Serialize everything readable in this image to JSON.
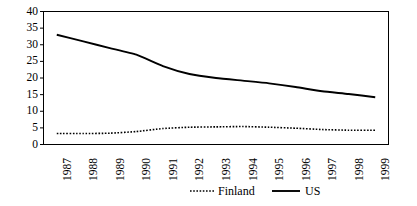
{
  "chart_data": {
    "type": "line",
    "title": "",
    "subtitle": "",
    "xlabel": "",
    "ylabel": "",
    "categories": [
      "1987",
      "1988",
      "1989",
      "1990",
      "1991",
      "1992",
      "1993",
      "1994",
      "1995",
      "1996",
      "1997",
      "1998",
      "1999"
    ],
    "x": [
      1987,
      1988,
      1989,
      1990,
      1991,
      1992,
      1993,
      1994,
      1995,
      1996,
      1997,
      1998,
      1999
    ],
    "series": [
      {
        "name": "Finland",
        "style": "dotted",
        "color": "#000000",
        "values": [
          3.3,
          3.3,
          3.4,
          3.9,
          4.8,
          5.2,
          5.3,
          5.4,
          5.2,
          4.9,
          4.5,
          4.3,
          4.3
        ]
      },
      {
        "name": "US",
        "style": "solid",
        "color": "#000000",
        "values": [
          33.0,
          31.0,
          29.0,
          27.0,
          23.6,
          21.2,
          20.0,
          19.2,
          18.4,
          17.3,
          16.0,
          15.2,
          14.2
        ]
      }
    ],
    "ylim": [
      0,
      40
    ],
    "yticks": [
      0,
      5,
      10,
      15,
      20,
      25,
      30,
      35,
      40
    ],
    "ytick_labels": [
      "0",
      "5",
      "10",
      "15",
      "20",
      "25",
      "30",
      "35",
      "40"
    ],
    "grid": false,
    "legend_position": "bottom",
    "legend": [
      {
        "label": "Finland",
        "marker": "dotted-line"
      },
      {
        "label": "US",
        "marker": "solid-line"
      }
    ],
    "plot_border": true
  }
}
